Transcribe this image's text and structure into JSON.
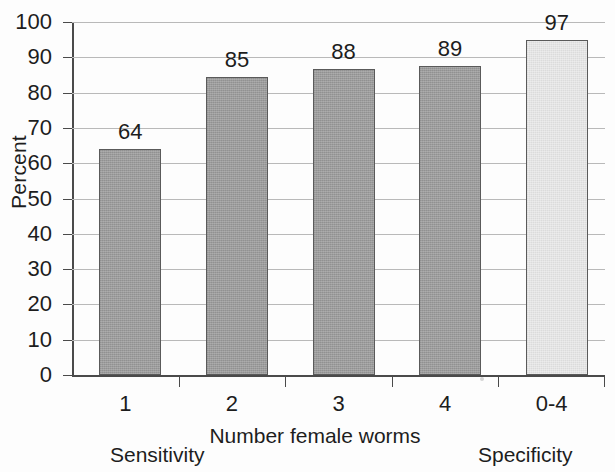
{
  "chart_data": {
    "type": "bar",
    "title": "",
    "xlabel": "Number female worms",
    "ylabel": "Percent",
    "categories": [
      "1",
      "2",
      "3",
      "4",
      "0-4"
    ],
    "values": [
      64,
      85,
      88,
      89,
      97
    ],
    "bar_visual_heights": [
      64,
      84.3,
      86.6,
      87.6,
      95
    ],
    "value_labels": [
      "64",
      "85",
      "88",
      "89",
      "97"
    ],
    "ylim": [
      0,
      100
    ],
    "ytick_labels": [
      "0",
      "10",
      "20",
      "30",
      "40",
      "50",
      "60",
      "70",
      "80",
      "90",
      "100"
    ],
    "ytick_values": [
      0,
      10,
      20,
      30,
      40,
      50,
      60,
      70,
      80,
      90,
      100
    ],
    "grid": true,
    "legend": "none",
    "series": [
      {
        "name": "Percent",
        "values": [
          64,
          85,
          88,
          89,
          97
        ],
        "colors": [
          "#9c9c9c",
          "#9c9c9c",
          "#9c9c9c",
          "#9c9c9c",
          "#e4e4e4"
        ]
      }
    ],
    "annotations": [
      {
        "text": "Sensitivity",
        "position": "below-left",
        "covers": [
          "1",
          "2",
          "3",
          "4"
        ]
      },
      {
        "text": "Specificity",
        "position": "below-right",
        "covers": [
          "0-4"
        ]
      }
    ],
    "colors": {
      "bar_dark": "#9c9c9c",
      "bar_light": "#e4e4e4",
      "bar_border": "#5a5a5a",
      "gridline": "#b9b9b9",
      "axis": "#4a4a4a",
      "text": "#1d1d1d",
      "background": "#fdfdfd"
    }
  },
  "axis": {
    "y_title": "Percent",
    "x_title": "Number female worms"
  },
  "annotations": {
    "left": "Sensitivity",
    "right": "Specificity"
  }
}
